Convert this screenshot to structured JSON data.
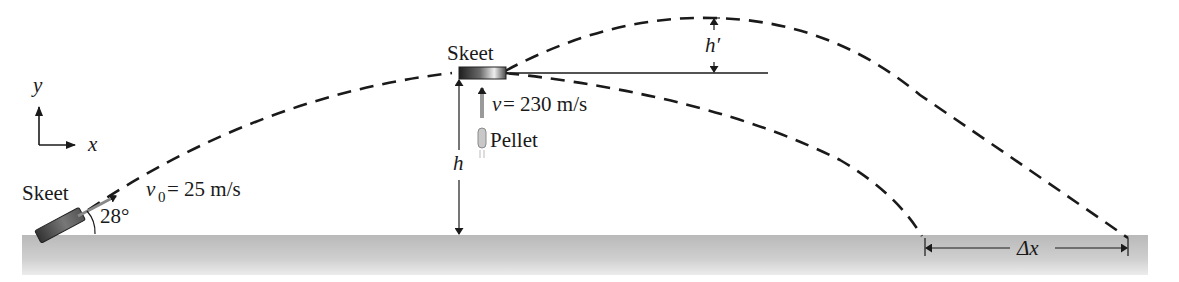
{
  "figure": {
    "axes": {
      "y_label": "y",
      "x_label": "x"
    },
    "launch": {
      "object_label": "Skeet",
      "velocity_symbol": "v",
      "velocity_subscript": "0",
      "velocity_value": " = 25 m/s",
      "angle_label": "28°"
    },
    "collision": {
      "object_label": "Skeet",
      "pellet_label": "Pellet",
      "pellet_velocity_symbol": "v",
      "pellet_velocity_value": " = 230 m/s",
      "height_label": "h",
      "extra_height_label": "h′"
    },
    "range_difference_label": "Δx",
    "colors": {
      "ground": "#bdbdbd",
      "ground_light": "#dcdcdc",
      "line": "#1a1a1a",
      "skeet_dark": "#2a2a2a",
      "pellet_gray": "#9a9a9a"
    }
  }
}
